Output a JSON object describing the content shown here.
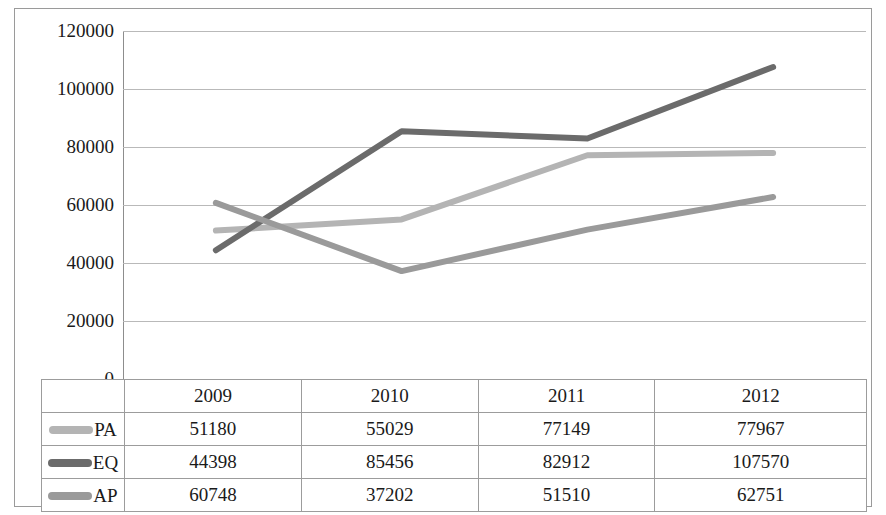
{
  "chart_data": {
    "type": "line",
    "title": "",
    "xlabel": "",
    "ylabel": "",
    "categories": [
      "2009",
      "2010",
      "2011",
      "2012"
    ],
    "ylim": [
      0,
      120000
    ],
    "yticks": [
      "0",
      "20000",
      "40000",
      "60000",
      "80000",
      "100000",
      "120000"
    ],
    "ytick_values": [
      0,
      20000,
      40000,
      60000,
      80000,
      100000,
      120000
    ],
    "grid": "horizontal",
    "legend_position": "table-left-column",
    "series": [
      {
        "name": "PA",
        "color": "#b4b4b4",
        "values": [
          51180,
          55029,
          77149,
          77967
        ]
      },
      {
        "name": "EQ",
        "color": "#6b6b6b",
        "values": [
          44398,
          85456,
          82912,
          107570
        ]
      },
      {
        "name": "AP",
        "color": "#9a9a9a",
        "values": [
          60748,
          37202,
          51510,
          62751
        ]
      }
    ]
  },
  "table": {
    "corner_label": "",
    "header": [
      "",
      "2009",
      "2010",
      "2011",
      "2012"
    ],
    "rows": [
      {
        "label": "PA",
        "swatch_color": "#b4b4b4",
        "cells": [
          "51180",
          "55029",
          "77149",
          "77967"
        ]
      },
      {
        "label": "EQ",
        "swatch_color": "#6b6b6b",
        "cells": [
          "44398",
          "85456",
          "82912",
          "107570"
        ]
      },
      {
        "label": "AP",
        "swatch_color": "#9a9a9a",
        "cells": [
          "60748",
          "37202",
          "51510",
          "62751"
        ]
      }
    ]
  }
}
